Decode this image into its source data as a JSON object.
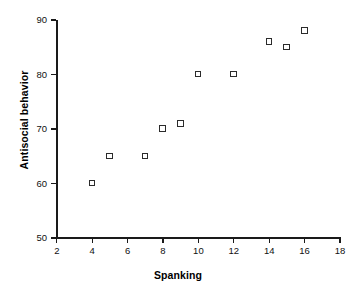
{
  "chart_data": {
    "type": "scatter",
    "title": "",
    "xlabel": "Spanking",
    "ylabel": "Antisocial behavior",
    "xlim": [
      2,
      18
    ],
    "ylim": [
      50,
      90
    ],
    "xticks": [
      2,
      4,
      6,
      8,
      10,
      12,
      14,
      16,
      18
    ],
    "yticks": [
      50,
      60,
      70,
      80,
      90
    ],
    "xtick_labels": [
      "2",
      "4",
      "6",
      "8",
      "10",
      "12",
      "14",
      "16",
      "18"
    ],
    "ytick_labels": [
      "50",
      "60",
      "70",
      "80",
      "90"
    ],
    "grid": false,
    "legend": false,
    "marker": "open-square",
    "marker_color": "#2b2b2b",
    "axis_color": "#1a1a1a",
    "background": "#ffffff",
    "points": [
      {
        "x": 4,
        "y": 60
      },
      {
        "x": 5,
        "y": 65
      },
      {
        "x": 7,
        "y": 65
      },
      {
        "x": 8,
        "y": 70
      },
      {
        "x": 9,
        "y": 71
      },
      {
        "x": 10,
        "y": 80
      },
      {
        "x": 12,
        "y": 80
      },
      {
        "x": 14,
        "y": 86
      },
      {
        "x": 15,
        "y": 85
      },
      {
        "x": 16,
        "y": 88
      }
    ],
    "x": [
      4,
      5,
      7,
      8,
      9,
      10,
      12,
      14,
      15,
      16
    ],
    "values": [
      60,
      65,
      65,
      70,
      71,
      80,
      80,
      86,
      85,
      88
    ]
  }
}
